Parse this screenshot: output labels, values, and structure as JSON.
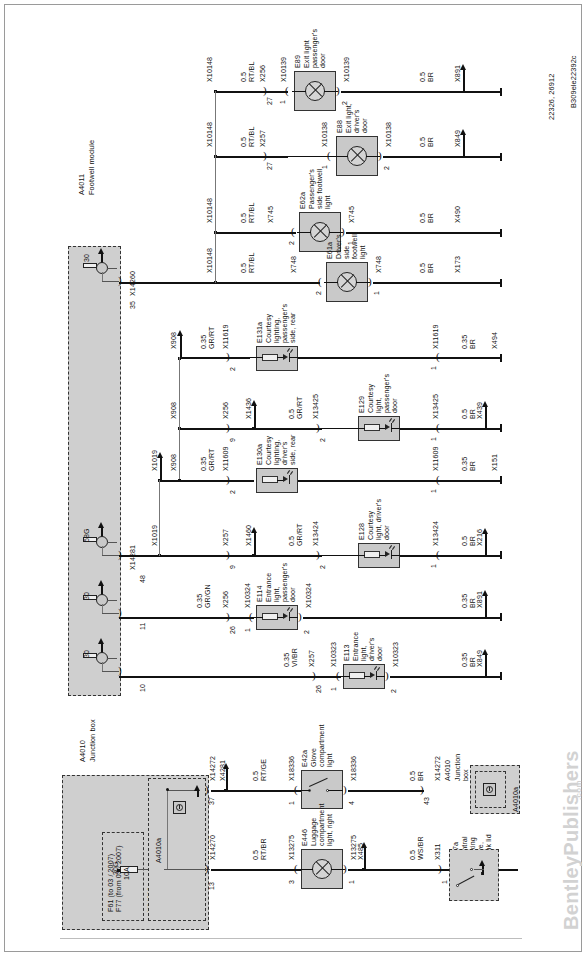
{
  "sheet": {
    "drawing_number": "B309ele22392c",
    "reference_numbers": "22326, 26912",
    "watermark": "BentleyPublishers",
    "watermark_suffix": ".com"
  },
  "modules": {
    "footwell": {
      "id": "A4011",
      "name": "Footwell module"
    },
    "junction_box": {
      "id": "A4010",
      "name": "Junction box"
    },
    "junction_box_sub": {
      "id": "A4010a"
    },
    "junction_box_right": {
      "id": "A4010",
      "name": "Junction box",
      "sub_id": "A4010a"
    },
    "fuse": {
      "terminal": "30G",
      "rating": "10A",
      "labels": "F61 (to 03 / 2007)\nF77 (from 03 / 2007)",
      "connector": "X04010",
      "pin": "10"
    }
  },
  "components": [
    {
      "id": "E89",
      "name": "Exit light\npassenger's\ndoor"
    },
    {
      "id": "E88",
      "name": "Exit light,\ndriver's\ndoor"
    },
    {
      "id": "E62a",
      "name": "Passenger's\nside footwell\nlight"
    },
    {
      "id": "E61a",
      "name": "Driver's\nside\nfootwell\nlight"
    },
    {
      "id": "E131a",
      "name": "Courtesy\nlighting,\npassenger's\nside, rear"
    },
    {
      "id": "E129",
      "name": "Courtesy\nlight,\npassenger's\ndoor"
    },
    {
      "id": "E130a",
      "name": "Courtesy\nlighting,\ndriver's\nside, rear"
    },
    {
      "id": "E128",
      "name": "Courtesy\nlight, driver's\ndoor"
    },
    {
      "id": "E114",
      "name": "Entrance\nlight,\npassenger's\ndoor"
    },
    {
      "id": "E113",
      "name": "Entrance\nlight,\ndriver's\ndoor"
    },
    {
      "id": "E42a",
      "name": "Glove\ncompartment\nlight"
    },
    {
      "id": "E446",
      "name": "Luggage\ncompartment\nlight, right"
    },
    {
      "id": "M17a",
      "name": "Central\nlocking\ndrive,\ntrunk lid"
    }
  ],
  "rows": [
    {
      "name": "exit-light-passenger-door",
      "bus_label": "X10148",
      "wire_left": "0.5\nRT/BL",
      "conn_left": "X256",
      "pin_left": "27",
      "comp_conn_in": "X10139",
      "comp_pin_in": "1",
      "component": "E89",
      "component_name": "Exit light\npassenger's\ndoor",
      "comp_conn_out": "X10139",
      "comp_pin_out": "2",
      "wire_right": "0.5\nBR",
      "ground": "X891"
    },
    {
      "name": "exit-light-drivers-door",
      "bus_label": "X10148",
      "wire_left": "0.5\nRT/BL",
      "conn_left": "X257",
      "pin_left": "27",
      "comp_conn_in": "X10138",
      "comp_pin_in": "1",
      "component": "E88",
      "component_name": "Exit light,\ndriver's\ndoor",
      "comp_conn_out": "X10138",
      "comp_pin_out": "2",
      "wire_right": "0.5\nBR",
      "ground": "X849"
    },
    {
      "name": "passenger-side-footwell-light",
      "bus_label": "X10148",
      "wire_left": "0.5\nRT/BL",
      "conn_left": "X745",
      "pin_left": "2",
      "component": "E62a",
      "component_name": "Passenger's\nside footwell\nlight",
      "comp_conn_out": "X745",
      "comp_pin_out": "1",
      "wire_right": "0.5\nBR",
      "ground": "X490"
    },
    {
      "name": "drivers-side-footwell-light",
      "bus_label": "X10148",
      "wire_left": "0.5\nRT/BL",
      "conn_left": "X748",
      "pin_left": "2",
      "component": "E61a",
      "component_name": "Driver's\nside\nfootwell\nlight",
      "comp_conn_out": "X748",
      "comp_pin_out": "1",
      "wire_right": "0.5\nBR",
      "ground": "X173"
    },
    {
      "name": "courtesy-lighting-passenger-rear",
      "bus_label": "X908",
      "wire_left": "0.35\nGR/RT",
      "conn_left": "X11619",
      "pin_left": "2",
      "component": "E131a",
      "component_name": "Courtesy\nlighting,\npassenger's\nside, rear",
      "comp_conn_out": "X11619",
      "comp_pin_out": "1",
      "wire_right": "0.35\nBR",
      "ground": "X494"
    },
    {
      "name": "courtesy-light-passenger-door",
      "bus_label": "X908",
      "conn_a": "X256",
      "pin_a": "9",
      "splice": "X1436",
      "wire_mid": "0.5\nGR/RT",
      "conn_b": "X13425",
      "pin_b": "2",
      "component": "E129",
      "component_name": "Courtesy\nlight,\npassenger's\ndoor",
      "comp_conn_out": "X13425",
      "comp_pin_out": "1",
      "wire_right": "0.5\nBR",
      "ground": "X439"
    },
    {
      "name": "courtesy-lighting-drivers-rear",
      "bus_label_a": "X1019",
      "bus_label_b": "X908",
      "wire_left": "0.35\nGR/RT",
      "conn_left": "X11609",
      "pin_left": "2",
      "component": "E130a",
      "component_name": "Courtesy\nlighting,\ndriver's\nside, rear",
      "comp_conn_out": "X11609",
      "comp_pin_out": "1",
      "wire_right": "0.35\nBR",
      "ground": "X151"
    },
    {
      "name": "courtesy-light-drivers-door",
      "bus_label": "X1019",
      "conn_a": "X257",
      "pin_a": "9",
      "splice": "X1460",
      "wire_mid": "0.5\nGR/RT",
      "conn_b": "X13424",
      "pin_b": "2",
      "component": "E128",
      "component_name": "Courtesy\nlight, driver's\ndoor",
      "comp_conn_out": "X13424",
      "comp_pin_out": "1",
      "wire_right": "0.5\nBR",
      "ground": "X216"
    },
    {
      "name": "entrance-light-passenger-door",
      "wire_left": "0.35\nGR/GN",
      "conn_left": "X256",
      "pin_left": "26",
      "comp_conn_in": "X10324",
      "comp_pin_in": "1",
      "component": "E114",
      "component_name": "Entrance\nlight,\npassenger's\ndoor",
      "comp_conn_out": "X10324",
      "comp_pin_out": "2",
      "wire_right": "0.35\nBR",
      "ground": "X891"
    },
    {
      "name": "entrance-light-drivers-door",
      "wire_left": "0.35\nVI/BR",
      "conn_left": "X257",
      "pin_left": "26",
      "comp_conn_in": "X10323",
      "comp_pin_in": "1",
      "component": "E113",
      "component_name": "Entrance\nlight,\ndriver's\ndoor",
      "comp_conn_out": "X10323",
      "comp_pin_out": "2",
      "wire_right": "0.35\nBR",
      "ground": "X849"
    }
  ],
  "footwell_pins": [
    {
      "pin": "35",
      "connector": "X14260",
      "terminal": "30"
    },
    {
      "pin": "48",
      "connector": "X14281",
      "terminal": "58G"
    },
    {
      "pin": "11",
      "connector": "",
      "terminal": "30"
    },
    {
      "pin": "10",
      "connector": "",
      "terminal": "30"
    }
  ],
  "bottom_rows": [
    {
      "name": "glove-compartment-light",
      "module_pin": "37",
      "module_conn": "X14272",
      "splice": "X4281",
      "wire_left": "0.5\nRT/GE",
      "comp_conn_in": "X18336",
      "comp_pin_in": "1",
      "component": "E42a",
      "component_name": "Glove\ncompartment\nlight",
      "comp_conn_out": "X18336",
      "comp_pin_out": "4",
      "wire_right": "0.5\nBR",
      "end_conn": "X14272",
      "end_pin": "43",
      "end_module": "A4010",
      "end_module_name": "Junction\nbox",
      "end_module_sub": "A4010a"
    },
    {
      "name": "luggage-compartment-light",
      "module_pin": "13",
      "module_conn": "X14270",
      "wire_left": "0.5\nRT/BR",
      "comp_conn_in": "X13275",
      "comp_pin_in": "3",
      "component": "E446",
      "component_name": "Luggage\ncompartment\nlight, right",
      "comp_conn_out": "X13275",
      "comp_pin_out": "1",
      "splice": "X485",
      "wire_right": "0.5\nWS/BR",
      "end_conn": "X311",
      "end_pin": "1",
      "end_component": "M17a",
      "end_component_name": "Central\nlocking\ndrive,\ntrunk lid"
    }
  ]
}
